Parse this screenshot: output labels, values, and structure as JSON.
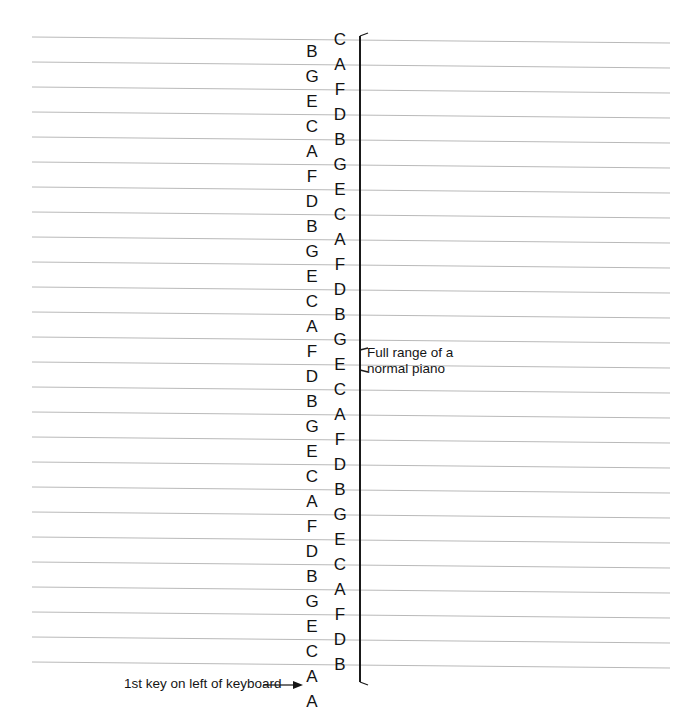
{
  "diagram": {
    "line_color": "#b9b9b9",
    "text_color": "#131313",
    "bracket_color": "#1a1a1a",
    "staff_line_count": 26,
    "staff_line_spacing_px": 25,
    "staff_line_first_y": 40,
    "staff_line_x_start": 32,
    "staff_line_x_end": 670,
    "staff_line_slope_px": 6
  },
  "notes_on_lines": {
    "description": "Letters centered on each staff line, read top to bottom",
    "column_x": 340,
    "first_y": 40,
    "step_y": 25,
    "letters": [
      "C",
      "A",
      "F",
      "D",
      "B",
      "G",
      "E",
      "C",
      "A",
      "F",
      "D",
      "B",
      "G",
      "E",
      "C",
      "A",
      "F",
      "D",
      "B",
      "G",
      "E",
      "C",
      "A",
      "F",
      "D",
      "B"
    ]
  },
  "notes_in_spaces": {
    "description": "Letters centered between staff lines, read top to bottom",
    "column_x": 312,
    "first_y": 52,
    "step_y": 25,
    "letters": [
      "B",
      "G",
      "E",
      "C",
      "A",
      "F",
      "D",
      "B",
      "G",
      "E",
      "C",
      "A",
      "F",
      "D",
      "B",
      "G",
      "E",
      "C",
      "A",
      "F",
      "D",
      "B",
      "G",
      "E",
      "C",
      "A"
    ]
  },
  "annotations": {
    "range_label": "Full range of a\nnormal piano",
    "first_key_label": "1st key on left of keyboard",
    "first_key_note": "A"
  }
}
